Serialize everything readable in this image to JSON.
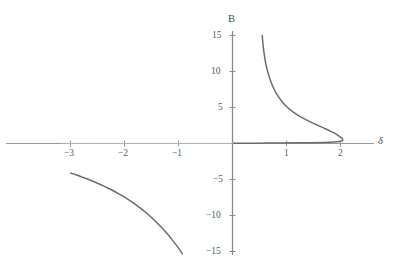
{
  "chart_data": {
    "type": "line",
    "title": "",
    "subtitle": "",
    "xlabel": "δ",
    "ylabel": "B",
    "xlim": [
      -3.2,
      2.6
    ],
    "ylim": [
      -15.5,
      15.5
    ],
    "grid": false,
    "legend": null,
    "x_ticks": [
      {
        "value": -3,
        "label": "−3"
      },
      {
        "value": -2,
        "label": "−2"
      },
      {
        "value": -1,
        "label": "−1"
      },
      {
        "value": 1,
        "label": "1"
      },
      {
        "value": 2,
        "label": "2"
      }
    ],
    "y_ticks": [
      {
        "value": 15,
        "label": "15"
      },
      {
        "value": 10,
        "label": "10"
      },
      {
        "value": 5,
        "label": "5"
      },
      {
        "value": -5,
        "label": "−5"
      },
      {
        "value": -10,
        "label": "−10"
      },
      {
        "value": -15,
        "label": "−15"
      }
    ],
    "series": [
      {
        "name": "upper-branch",
        "comment": "right branch: vertical asymptote near delta = 0.5, descends and turns back at delta = 2",
        "points": [
          [
            0.55,
            15.0
          ],
          [
            0.57,
            13.4
          ],
          [
            0.6,
            11.8
          ],
          [
            0.63,
            10.6
          ],
          [
            0.67,
            9.5
          ],
          [
            0.72,
            8.4
          ],
          [
            0.78,
            7.4
          ],
          [
            0.85,
            6.5
          ],
          [
            0.93,
            5.7
          ],
          [
            1.02,
            5.0
          ],
          [
            1.12,
            4.4
          ],
          [
            1.23,
            3.85
          ],
          [
            1.35,
            3.35
          ],
          [
            1.47,
            2.9
          ],
          [
            1.6,
            2.45
          ],
          [
            1.72,
            2.05
          ],
          [
            1.83,
            1.65
          ],
          [
            1.92,
            1.3
          ],
          [
            1.98,
            1.0
          ],
          [
            2.02,
            0.78
          ],
          [
            2.04,
            0.58
          ],
          [
            2.03,
            0.4
          ],
          [
            1.98,
            0.28
          ],
          [
            1.88,
            0.2
          ],
          [
            1.7,
            0.15
          ],
          [
            1.45,
            0.12
          ],
          [
            1.15,
            0.09
          ],
          [
            0.85,
            0.07
          ],
          [
            0.55,
            0.05
          ],
          [
            0.25,
            0.03
          ],
          [
            0.02,
            0.02
          ]
        ]
      },
      {
        "name": "lower-branch",
        "comment": "left branch in third quadrant, from delta = -3 down past delta = -0.9",
        "points": [
          [
            -3.0,
            -4.1
          ],
          [
            -2.9,
            -4.35
          ],
          [
            -2.8,
            -4.62
          ],
          [
            -2.7,
            -4.9
          ],
          [
            -2.6,
            -5.2
          ],
          [
            -2.5,
            -5.52
          ],
          [
            -2.4,
            -5.86
          ],
          [
            -2.3,
            -6.22
          ],
          [
            -2.2,
            -6.6
          ],
          [
            -2.1,
            -7.02
          ],
          [
            -2.0,
            -7.46
          ],
          [
            -1.9,
            -7.94
          ],
          [
            -1.8,
            -8.46
          ],
          [
            -1.7,
            -9.02
          ],
          [
            -1.6,
            -9.62
          ],
          [
            -1.5,
            -10.28
          ],
          [
            -1.4,
            -11.0
          ],
          [
            -1.3,
            -11.78
          ],
          [
            -1.2,
            -12.62
          ],
          [
            -1.12,
            -13.35
          ],
          [
            -1.04,
            -14.12
          ],
          [
            -0.97,
            -14.85
          ],
          [
            -0.93,
            -15.3
          ]
        ]
      },
      {
        "name": "left-axis-trace",
        "comment": "faint trace running along negative delta axis near B = 0",
        "points": [
          [
            -3.15,
            0.02
          ],
          [
            -2.5,
            0.02
          ],
          [
            -1.5,
            0.02
          ],
          [
            -0.5,
            0.02
          ],
          [
            0.0,
            0.02
          ]
        ]
      }
    ],
    "colors": {
      "curve": "#6b6b6b",
      "axis": "#8a8a8a",
      "tick_label": "#5c5c5c",
      "axis_label": "#4a4a4a",
      "background": "#ffffff"
    }
  },
  "labels": {
    "y_axis_name": "B",
    "x_axis_name": "δ",
    "x_tick_m3": "−3",
    "x_tick_m2": "−2",
    "x_tick_m1": "−1",
    "x_tick_1": "1",
    "x_tick_2": "2",
    "y_tick_15": "15",
    "y_tick_10": "10",
    "y_tick_5": "5",
    "y_tick_m5": "−5",
    "y_tick_m10": "−10",
    "y_tick_m15": "−15"
  }
}
